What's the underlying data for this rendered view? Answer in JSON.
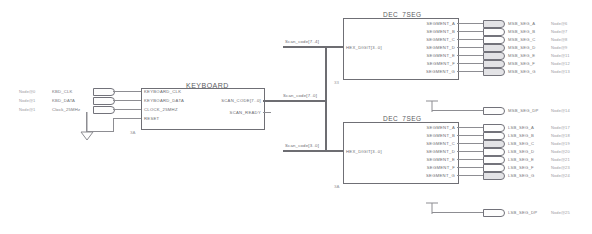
{
  "sheet": {
    "title": "keyboard to dual 7-segment decoder schematic"
  },
  "inputs": [
    {
      "node": "Node@0",
      "label": "KBD_CLK",
      "pin": "input-pin"
    },
    {
      "node": "Node@1",
      "label": "KBD_DATA",
      "pin": "input-pin"
    },
    {
      "node": "Node@1",
      "label": "Clock_25MHz",
      "pin": "input-pin"
    }
  ],
  "keyboard_block": {
    "title": "KEYBOARD",
    "instance": "3A",
    "inputs": [
      "KEYBOARD_CLK",
      "KEYBOARD_DATA",
      "CLOCK_25MHZ",
      "RESET"
    ],
    "outputs": [
      "SCAN_CODE[7..0]",
      "SCAN_READY"
    ]
  },
  "buses": {
    "scan_code_main": "Scan_code[7..0]",
    "scan_code_msb": "Scan_code[7..4]",
    "scan_code_lsb": "Scan_code[3..0]"
  },
  "dec_msb": {
    "title": "DEC_7SEG",
    "instance": "33",
    "input": "HEX_DIGIT[3..0]",
    "outputs": [
      "SEGMENT_A",
      "SEGMENT_B",
      "SEGMENT_C",
      "SEGMENT_D",
      "SEGMENT_E",
      "SEGMENT_F",
      "SEGMENT_G"
    ]
  },
  "dec_lsb": {
    "title": "DEC_7SEG",
    "instance": "3A",
    "input": "HEX_DIGIT[3..0]",
    "outputs": [
      "SEGMENT_A",
      "SEGMENT_B",
      "SEGMENT_C",
      "SEGMENT_D",
      "SEGMENT_E",
      "SEGMENT_F",
      "SEGMENT_G"
    ]
  },
  "outputs_msb": [
    {
      "label": "MSB_SEG_A",
      "node": "Node@6"
    },
    {
      "label": "MSB_SEG_B",
      "node": "Node@7"
    },
    {
      "label": "MSB_SEG_C",
      "node": "Node@8"
    },
    {
      "label": "MSB_SEG_D",
      "node": "Node@9"
    },
    {
      "label": "MSB_SEG_E",
      "node": "Node@11"
    },
    {
      "label": "MSB_SEG_F",
      "node": "Node@12"
    },
    {
      "label": "MSB_SEG_G",
      "node": "Node@13"
    }
  ],
  "outputs_lsb": [
    {
      "label": "LSB_SEG_A",
      "node": "Node@17"
    },
    {
      "label": "LSB_SEG_B",
      "node": "Node@18"
    },
    {
      "label": "LSB_SEG_C",
      "node": "Node@19"
    },
    {
      "label": "LSB_SEG_D",
      "node": "Node@20"
    },
    {
      "label": "LSB_SEG_E",
      "node": "Node@21"
    },
    {
      "label": "LSB_SEG_F",
      "node": "Node@23"
    },
    {
      "label": "LSB_SEG_G",
      "node": "Node@24"
    }
  ],
  "dp_outputs": [
    {
      "label": "MSB_SEG_DP",
      "node": "Node@14",
      "source": "VCC"
    },
    {
      "label": "LSB_SEG_DP",
      "node": "Node@25",
      "source": "VCC"
    }
  ],
  "symbols": {
    "ground": "gnd-symbol",
    "vcc": "vcc-symbol"
  },
  "colors": {
    "wire": "#8d8d92",
    "outline": "#6f6f75",
    "text": "#6a6a70",
    "node_text": "#9a9aa0"
  }
}
